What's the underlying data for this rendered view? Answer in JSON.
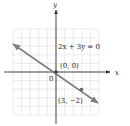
{
  "chart_data": {
    "type": "line",
    "title": "",
    "xlabel": "x",
    "ylabel": "y",
    "xlim": [
      -5,
      5
    ],
    "ylim": [
      -5,
      5
    ],
    "grid": true,
    "series": [
      {
        "name": "2x + 3y = 0",
        "equation": "2x + 3y = 0",
        "slope": -0.6667,
        "intercept": 0,
        "x": [
          -5,
          5
        ],
        "y": [
          3.333,
          -3.333
        ],
        "color": "#7a7a7a"
      }
    ],
    "points": [
      {
        "x": 0,
        "y": 0,
        "label": "(0, 0)"
      },
      {
        "x": 3,
        "y": -2,
        "label": "(3, −2)"
      }
    ],
    "annotations": [
      {
        "text": "2x + 3y = 0"
      },
      {
        "text": "(0, 0)"
      },
      {
        "text": "(3, −2)"
      },
      {
        "text": "0"
      }
    ]
  },
  "labels": {
    "x_axis": "x",
    "y_axis": "y",
    "equation": "2x + 3y = 0",
    "origin_point": "(0, 0)",
    "second_point": "(3, −2)",
    "origin_tick": "0"
  },
  "colors": {
    "grid": "#dcdcdc",
    "axis": "#333333",
    "line": "#808080",
    "point": "#555555",
    "text": "#2a2a2a"
  }
}
